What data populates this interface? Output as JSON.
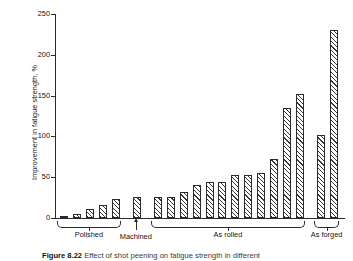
{
  "figure": {
    "caption_label": "Figure 8.22",
    "caption_text": "Effect of shot peening on fatigue strength in different"
  },
  "chart_data": {
    "type": "bar",
    "title": "",
    "xlabel": "",
    "ylabel": "Improvement in fatigue strength, %",
    "ylim": [
      0,
      250
    ],
    "yticks": [
      0,
      50,
      100,
      150,
      200,
      250
    ],
    "ytick_labels": [
      "0",
      "50",
      "100",
      "150",
      "200",
      "250"
    ],
    "grid": false,
    "legend": "none",
    "bar_fill": "diagonal-hatch",
    "categories": [
      "P1",
      "P2",
      "P3",
      "P4",
      "P5",
      "M1",
      "R1",
      "R2",
      "R3",
      "R4",
      "R5",
      "R6",
      "R7",
      "R8",
      "R9",
      "R10",
      "R11",
      "R12",
      "F1",
      "F2"
    ],
    "values": [
      3,
      5,
      11,
      16,
      23,
      26,
      26,
      26,
      32,
      41,
      44,
      44,
      53,
      53,
      55,
      72,
      135,
      152,
      102,
      231
    ],
    "groups": [
      {
        "label": "Polished",
        "start": 0,
        "count": 5,
        "marker": "brace"
      },
      {
        "label": "Machined",
        "start": 5,
        "count": 1,
        "marker": "arrow"
      },
      {
        "label": "As rolled",
        "start": 6,
        "count": 12,
        "marker": "brace"
      },
      {
        "label": "As forged",
        "start": 18,
        "count": 2,
        "marker": "brace"
      }
    ]
  }
}
